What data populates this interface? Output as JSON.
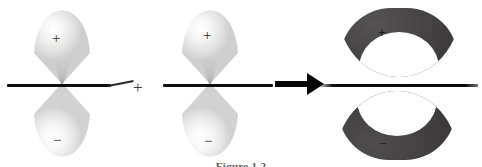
{
  "figure": {
    "background_color": "#ffffff",
    "width": 482,
    "height": 167
  },
  "operators": {
    "plus_symbol": "+",
    "arrow_symbol": "→"
  },
  "reactants": [
    {
      "name": "p-orbital-left",
      "type": "p atomic orbital",
      "lobe_color": "#e8e8e8",
      "lobes": [
        {
          "position": "top",
          "sign": "+"
        },
        {
          "position": "bottom",
          "sign": "−"
        }
      ],
      "axis_label": "nodal-axis"
    },
    {
      "name": "p-orbital-right",
      "type": "p atomic orbital",
      "lobe_color": "#e8e8e8",
      "lobes": [
        {
          "position": "top",
          "sign": "+"
        },
        {
          "position": "bottom",
          "sign": "−"
        }
      ],
      "axis_label": "nodal-axis"
    }
  ],
  "product": {
    "name": "pi-antibonding-orbital",
    "type": "molecular orbital",
    "lobe_color": "#3a3838",
    "lobes": [
      {
        "position": "top",
        "sign": "+"
      },
      {
        "position": "bottom",
        "sign": "−"
      }
    ],
    "axis_label": "nodal-plane"
  },
  "caption": {
    "text": "Figure 1.2"
  }
}
